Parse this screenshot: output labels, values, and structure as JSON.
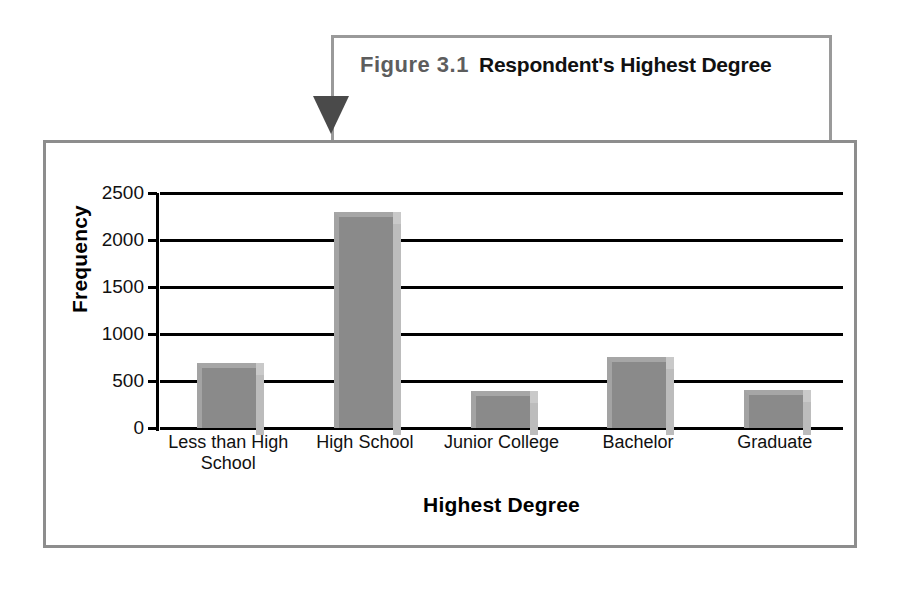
{
  "callout": {
    "figure_number": "Figure 3.1",
    "figure_title": "Respondent's Highest Degree",
    "border_color": "#9a9a9a",
    "arrow_color": "#4a4a4a"
  },
  "frame": {
    "border_color": "#8d8d8d"
  },
  "chart_data": {
    "type": "bar",
    "categories": [
      "Less than High School",
      "High School",
      "Junior College",
      "Bachelor",
      "Graduate"
    ],
    "values": [
      690,
      2300,
      390,
      760,
      400
    ],
    "xlabel": "Highest Degree",
    "ylabel": "Frequency",
    "ylim": [
      0,
      2500
    ],
    "yticks": [
      0,
      500,
      1000,
      1500,
      2000,
      2500
    ],
    "ytick_labels": [
      "0",
      "500",
      "1000",
      "1500",
      "2000",
      "2500"
    ],
    "grid": true,
    "legend": false,
    "bar_color": "#8a8a8a",
    "bar_highlight_color": "#a6a6a6",
    "bar_shadow_color": "#bcbcbc",
    "axis_color": "#000000"
  }
}
